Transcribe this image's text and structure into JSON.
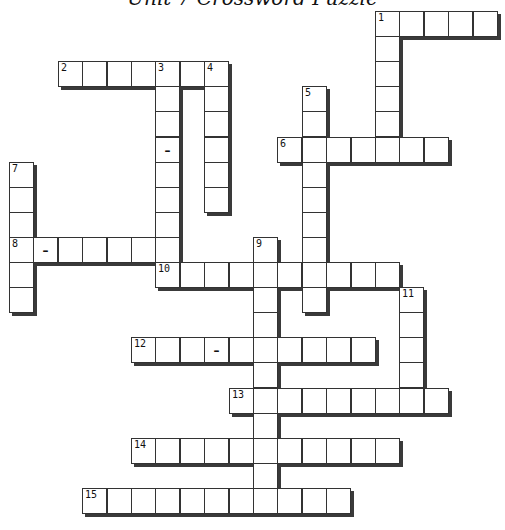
{
  "title": "Unit 7 Crossword Puzzle",
  "grid": {
    "origin_x": 9,
    "origin_y": 11,
    "cell_w": 24.4,
    "cell_h": 25.1
  },
  "entries": [
    {
      "number": "1",
      "direction": "across",
      "col": 15,
      "row": 0,
      "length": 5,
      "dashes": []
    },
    {
      "number": "1",
      "direction": "down",
      "col": 15,
      "row": 0,
      "length": 6,
      "dashes": []
    },
    {
      "number": "2",
      "direction": "across",
      "col": 2,
      "row": 2,
      "length": 7,
      "dashes": []
    },
    {
      "number": "3",
      "direction": "down",
      "col": 6,
      "row": 2,
      "length": 9,
      "dashes": [
        3
      ]
    },
    {
      "number": "4",
      "direction": "down",
      "col": 8,
      "row": 2,
      "length": 6,
      "dashes": []
    },
    {
      "number": "5",
      "direction": "down",
      "col": 12,
      "row": 3,
      "length": 9,
      "dashes": []
    },
    {
      "number": "6",
      "direction": "across",
      "col": 11,
      "row": 5,
      "length": 7,
      "dashes": []
    },
    {
      "number": "7",
      "direction": "down",
      "col": 0,
      "row": 6,
      "length": 6,
      "dashes": []
    },
    {
      "number": "8",
      "direction": "across",
      "col": 0,
      "row": 9,
      "length": 7,
      "dashes": [
        1
      ]
    },
    {
      "number": "9",
      "direction": "down",
      "col": 10,
      "row": 9,
      "length": 11,
      "dashes": []
    },
    {
      "number": "10",
      "direction": "across",
      "col": 6,
      "row": 10,
      "length": 10,
      "dashes": []
    },
    {
      "number": "11",
      "direction": "down",
      "col": 16,
      "row": 11,
      "length": 5,
      "dashes": []
    },
    {
      "number": "12",
      "direction": "across",
      "col": 5,
      "row": 13,
      "length": 10,
      "dashes": [
        3
      ]
    },
    {
      "number": "13",
      "direction": "across",
      "col": 9,
      "row": 15,
      "length": 9,
      "dashes": []
    },
    {
      "number": "14",
      "direction": "across",
      "col": 5,
      "row": 17,
      "length": 11,
      "dashes": []
    },
    {
      "number": "15",
      "direction": "across",
      "col": 3,
      "row": 19,
      "length": 11,
      "dashes": []
    }
  ],
  "dash_char": "–"
}
